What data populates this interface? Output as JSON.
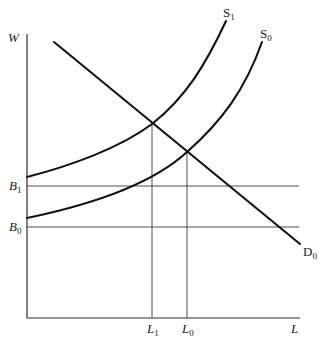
{
  "diagram": {
    "type": "supply-demand",
    "axes": {
      "y_label": "W",
      "x_label": "L"
    },
    "curves": [
      {
        "id": "S1",
        "label_main": "S",
        "label_sub": "1",
        "kind": "supply"
      },
      {
        "id": "S0",
        "label_main": "S",
        "label_sub": "0",
        "kind": "supply"
      },
      {
        "id": "D0",
        "label_main": "D",
        "label_sub": "0",
        "kind": "demand"
      }
    ],
    "horizontal_levels": [
      {
        "id": "B1",
        "label_main": "B",
        "label_sub": "1"
      },
      {
        "id": "B0",
        "label_main": "B",
        "label_sub": "0"
      }
    ],
    "vertical_levels": [
      {
        "id": "L1",
        "label_main": "L",
        "label_sub": "1"
      },
      {
        "id": "L0",
        "label_main": "L",
        "label_sub": "0"
      }
    ],
    "equilibria": [
      {
        "supply": "S1",
        "demand": "D0",
        "quantity": "L1"
      },
      {
        "supply": "S0",
        "demand": "D0",
        "quantity": "L0"
      }
    ],
    "colors": {
      "line": "#111111",
      "background": "#ffffff"
    }
  }
}
